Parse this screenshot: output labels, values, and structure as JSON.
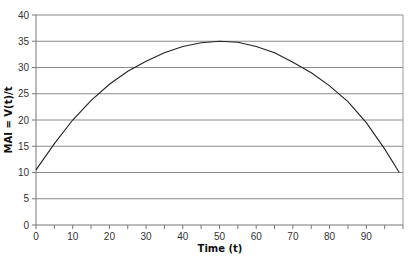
{
  "chart_data": {
    "type": "line",
    "title": "",
    "xlabel": "Time (t)",
    "ylabel": "MAI = V(t)/t",
    "xlim": [
      0,
      100
    ],
    "ylim": [
      0,
      40
    ],
    "x_ticks": [
      0,
      10,
      20,
      30,
      40,
      50,
      60,
      70,
      80,
      90
    ],
    "y_ticks": [
      0,
      5,
      10,
      15,
      20,
      25,
      30,
      35,
      40
    ],
    "grid": "horizontal",
    "legend": "none",
    "series": [
      {
        "name": "MAI",
        "x": [
          0,
          5,
          10,
          15,
          20,
          25,
          30,
          35,
          40,
          45,
          50,
          55,
          60,
          65,
          70,
          75,
          80,
          85,
          90,
          95,
          99
        ],
        "values": [
          10.5,
          15.5,
          20,
          23.7,
          26.8,
          29.3,
          31.2,
          32.8,
          34,
          34.7,
          35,
          34.8,
          34,
          32.8,
          31,
          29,
          26.5,
          23.5,
          19.5,
          14.5,
          10
        ]
      }
    ]
  }
}
